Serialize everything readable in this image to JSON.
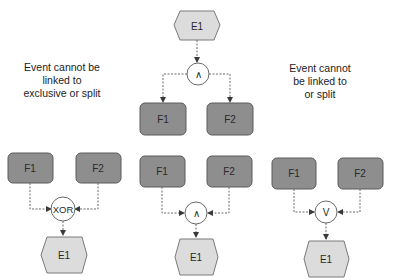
{
  "notes": {
    "left": [
      "Event cannot be",
      "linked to",
      "exclusive or split"
    ],
    "right": [
      "Event cannot",
      "be linked to",
      "or split"
    ]
  },
  "colors": {
    "function_fill": "#8e8e8e",
    "event_fill": "#dcdcdc",
    "connector_fill": "#ffffff",
    "line": "#6a6a6a"
  },
  "diagrams": {
    "top_split": {
      "event": "E1",
      "connector": "∧",
      "functions": [
        "F1",
        "F2"
      ]
    },
    "bottom_xor": {
      "functions": [
        "F1",
        "F2"
      ],
      "connector": "XOR",
      "event": "E1"
    },
    "bottom_and": {
      "functions": [
        "F1",
        "F2"
      ],
      "connector": "∧",
      "event": "E1"
    },
    "bottom_or": {
      "functions": [
        "F1",
        "F2"
      ],
      "connector": "V",
      "event": "E1"
    }
  }
}
